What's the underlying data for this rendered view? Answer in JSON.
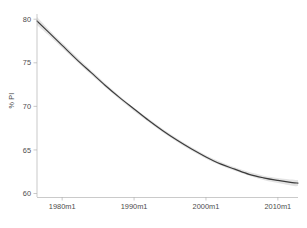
{
  "chart_data": {
    "type": "line",
    "title": "",
    "subtitle": "",
    "xlabel": "",
    "ylabel": "% PI",
    "xlim": [
      1976.5,
      2012.8
    ],
    "ylim": [
      59.6,
      80.6
    ],
    "grid": false,
    "legend": false,
    "legend_position": "none",
    "x_tick_labels": [
      "1980m1",
      "1990m1",
      "2000m1",
      "2010m1"
    ],
    "x_tick_values": [
      1980,
      1990,
      2000,
      2010
    ],
    "y_tick_labels": [
      "60",
      "65",
      "70",
      "75",
      "80"
    ],
    "y_tick_values": [
      60,
      65,
      70,
      75,
      80
    ],
    "series": [
      {
        "name": "fitted",
        "style": "solid-dark-line",
        "color": "#3b3b3b",
        "x": [
          1976.5,
          1978,
          1980,
          1982,
          1984,
          1986,
          1988,
          1990,
          1992,
          1994,
          1996,
          1998,
          2000,
          2002,
          2004,
          2006,
          2008,
          2010,
          2012,
          2012.8
        ],
        "values": [
          79.8,
          78.6,
          77.0,
          75.4,
          73.9,
          72.4,
          71.0,
          69.7,
          68.4,
          67.2,
          66.1,
          65.1,
          64.2,
          63.4,
          62.8,
          62.2,
          61.8,
          61.5,
          61.25,
          61.2
        ]
      },
      {
        "name": "confidence-band",
        "style": "shaded-area",
        "color": "#d9d9d9",
        "x": [
          1976.5,
          1978,
          1980,
          1984,
          1988,
          1992,
          1996,
          2000,
          2004,
          2008,
          2012,
          2012.8
        ],
        "upper": [
          80.25,
          78.95,
          77.3,
          74.15,
          71.2,
          68.6,
          66.3,
          64.4,
          63.0,
          62.05,
          61.6,
          61.55
        ],
        "lower": [
          79.35,
          78.25,
          76.7,
          73.65,
          70.8,
          68.2,
          65.9,
          64.0,
          62.6,
          61.55,
          60.9,
          60.85
        ]
      }
    ]
  },
  "axes": {
    "y_title": "% PI"
  }
}
